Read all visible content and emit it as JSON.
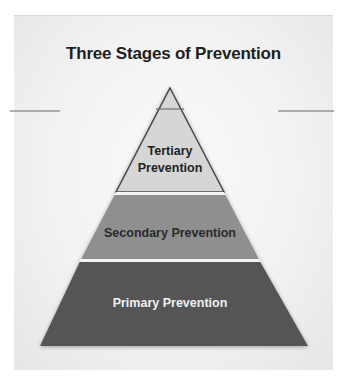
{
  "diagram": {
    "title": "Three Stages of Prevention",
    "type": "pyramid",
    "levels": [
      {
        "position": "top",
        "label_line1": "Tertiary",
        "label_line2": "Prevention",
        "color": "#d6d6d6",
        "text_color": "#222222"
      },
      {
        "position": "middle",
        "label": "Secondary Prevention",
        "color": "#8f8f8f",
        "text_color": "#2a2a2a"
      },
      {
        "position": "bottom",
        "label": "Primary Prevention",
        "color": "#555555",
        "text_color": "#f0f0f0"
      }
    ],
    "outline_color": "#4a4a4a",
    "separator_color": "#f4f4f4",
    "background_color": "#f0f0f0"
  }
}
